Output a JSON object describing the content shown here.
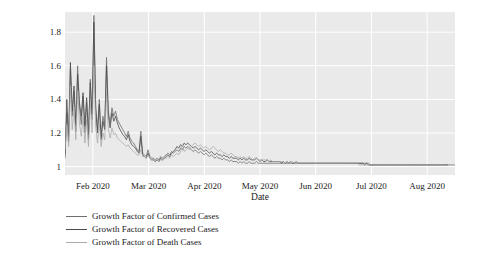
{
  "chart_data": {
    "type": "line",
    "title": "",
    "xlabel": "Date",
    "ylabel": "Growth Factor",
    "grid": true,
    "legend_position": "below-left",
    "xlim": [
      "2020-01-23",
      "2020-09-05"
    ],
    "ylim": [
      0.95,
      1.92
    ],
    "xticks": [
      "Feb 2020",
      "Mar 2020",
      "Apr 2020",
      "May 2020",
      "Jun 2020",
      "Jul 2020",
      "Aug 2020"
    ],
    "yticks": [
      "1",
      "1.2",
      "1.4",
      "1.6",
      "1.8"
    ],
    "ytick_values": [
      1,
      1.2,
      1.4,
      1.6,
      1.8
    ],
    "colors": {
      "confirmed": "#6e6e6e",
      "recovered": "#4a4a4a",
      "death": "#aaaaaa",
      "plot_background": "#eaeaea",
      "grid": "#ffffff",
      "text": "#1a1a1a"
    },
    "series": [
      {
        "name": "Growth Factor of Confirmed Cases",
        "color": "#6e6e6e",
        "values": [
          1.07,
          1.32,
          1.18,
          1.58,
          1.3,
          1.45,
          1.21,
          1.6,
          1.35,
          1.25,
          1.42,
          1.2,
          1.38,
          1.16,
          1.52,
          1.28,
          1.9,
          1.36,
          1.22,
          1.4,
          1.18,
          1.3,
          1.24,
          1.65,
          1.33,
          1.26,
          1.35,
          1.3,
          1.33,
          1.28,
          1.26,
          1.24,
          1.22,
          1.2,
          1.18,
          1.21,
          1.17,
          1.15,
          1.14,
          1.12,
          1.1,
          1.09,
          1.21,
          1.08,
          1.07,
          1.06,
          1.1,
          1.06,
          1.05,
          1.05,
          1.04,
          1.05,
          1.04,
          1.06,
          1.05,
          1.06,
          1.07,
          1.08,
          1.07,
          1.09,
          1.08,
          1.09,
          1.1,
          1.09,
          1.11,
          1.1,
          1.12,
          1.11,
          1.12,
          1.11,
          1.1,
          1.09,
          1.1,
          1.09,
          1.08,
          1.09,
          1.08,
          1.07,
          1.08,
          1.07,
          1.06,
          1.07,
          1.06,
          1.05,
          1.06,
          1.05,
          1.05,
          1.04,
          1.05,
          1.04,
          1.04,
          1.03,
          1.04,
          1.03,
          1.03,
          1.03,
          1.02,
          1.03,
          1.02,
          1.03,
          1.02,
          1.02,
          1.03,
          1.02,
          1.02,
          1.02,
          1.03,
          1.02,
          1.02,
          1.02,
          1.02,
          1.02,
          1.02,
          1.02,
          1.02,
          1.02,
          1.02,
          1.02,
          1.02,
          1.02,
          1.02,
          1.02,
          1.02,
          1.02,
          1.02,
          1.02,
          1.02,
          1.02,
          1.02,
          1.02,
          1.02,
          1.02,
          1.02,
          1.02,
          1.02,
          1.02,
          1.02,
          1.02,
          1.02,
          1.02,
          1.02,
          1.02,
          1.02,
          1.02,
          1.02,
          1.02,
          1.02,
          1.02,
          1.02,
          1.02,
          1.02,
          1.02,
          1.02,
          1.02,
          1.02,
          1.02,
          1.02,
          1.02,
          1.02,
          1.02,
          1.02,
          1.02,
          1.02,
          1.02,
          1.02,
          1.02,
          1.02,
          1.02,
          1.02,
          1.01,
          1.01,
          1.01,
          1.01,
          1.01,
          1.01,
          1.01,
          1.01,
          1.01,
          1.01,
          1.01,
          1.01,
          1.01,
          1.01,
          1.01,
          1.01,
          1.01,
          1.01,
          1.01,
          1.01,
          1.01,
          1.01,
          1.01,
          1.01,
          1.01,
          1.01,
          1.01,
          1.01,
          1.01,
          1.01,
          1.01,
          1.01,
          1.01,
          1.01,
          1.01,
          1.01,
          1.01,
          1.01,
          1.01,
          1.01,
          1.01,
          1.01,
          1.01,
          1.01,
          1.01,
          1.01,
          1.01,
          1.01
        ]
      },
      {
        "name": "Growth Factor of Recovered Cases",
        "color": "#4a4a4a",
        "values": [
          1.05,
          1.4,
          1.15,
          1.62,
          1.33,
          1.48,
          1.25,
          1.55,
          1.38,
          1.3,
          1.44,
          1.24,
          1.41,
          1.19,
          1.5,
          1.31,
          1.86,
          1.34,
          1.2,
          1.37,
          1.16,
          1.27,
          1.22,
          1.6,
          1.3,
          1.23,
          1.32,
          1.27,
          1.3,
          1.26,
          1.23,
          1.21,
          1.19,
          1.18,
          1.16,
          1.19,
          1.15,
          1.13,
          1.12,
          1.11,
          1.09,
          1.08,
          1.18,
          1.07,
          1.06,
          1.05,
          1.08,
          1.05,
          1.04,
          1.04,
          1.03,
          1.04,
          1.03,
          1.05,
          1.04,
          1.05,
          1.06,
          1.07,
          1.06,
          1.08,
          1.09,
          1.1,
          1.12,
          1.11,
          1.13,
          1.12,
          1.14,
          1.13,
          1.14,
          1.13,
          1.12,
          1.11,
          1.12,
          1.11,
          1.1,
          1.11,
          1.1,
          1.09,
          1.1,
          1.09,
          1.08,
          1.09,
          1.08,
          1.07,
          1.08,
          1.07,
          1.07,
          1.06,
          1.07,
          1.06,
          1.06,
          1.05,
          1.06,
          1.05,
          1.05,
          1.05,
          1.04,
          1.05,
          1.04,
          1.05,
          1.04,
          1.04,
          1.05,
          1.04,
          1.04,
          1.04,
          1.05,
          1.04,
          1.03,
          1.04,
          1.03,
          1.03,
          1.04,
          1.03,
          1.03,
          1.03,
          1.03,
          1.03,
          1.03,
          1.03,
          1.02,
          1.03,
          1.02,
          1.03,
          1.02,
          1.03,
          1.02,
          1.02,
          1.03,
          1.02,
          1.02,
          1.02,
          1.02,
          1.02,
          1.02,
          1.02,
          1.02,
          1.02,
          1.02,
          1.02,
          1.02,
          1.02,
          1.02,
          1.02,
          1.02,
          1.02,
          1.02,
          1.02,
          1.02,
          1.02,
          1.02,
          1.02,
          1.02,
          1.02,
          1.02,
          1.02,
          1.02,
          1.02,
          1.02,
          1.02,
          1.02,
          1.02,
          1.02,
          1.02,
          1.02,
          1.02,
          1.01,
          1.02,
          1.01,
          1.01,
          1.01,
          1.01,
          1.01,
          1.01,
          1.01,
          1.01,
          1.01,
          1.01,
          1.01,
          1.01,
          1.01,
          1.01,
          1.01,
          1.01,
          1.01,
          1.01,
          1.01,
          1.01,
          1.01,
          1.01,
          1.01,
          1.01,
          1.01,
          1.01,
          1.01,
          1.01,
          1.01,
          1.01,
          1.01,
          1.01,
          1.01,
          1.01,
          1.01,
          1.01,
          1.01,
          1.01,
          1.01,
          1.01,
          1.01,
          1.01,
          1.01,
          1.01,
          1.01
        ]
      },
      {
        "name": "Growth Factor of Death Cases",
        "color": "#aaaaaa",
        "values": [
          1.1,
          1.25,
          1.12,
          1.48,
          1.22,
          1.35,
          1.16,
          1.45,
          1.26,
          1.18,
          1.3,
          1.14,
          1.28,
          1.12,
          1.38,
          1.2,
          1.6,
          1.24,
          1.14,
          1.26,
          1.12,
          1.2,
          1.16,
          1.44,
          1.22,
          1.17,
          1.23,
          1.19,
          1.2,
          1.17,
          1.16,
          1.15,
          1.14,
          1.13,
          1.12,
          1.13,
          1.11,
          1.1,
          1.09,
          1.08,
          1.07,
          1.07,
          1.1,
          1.06,
          1.06,
          1.05,
          1.07,
          1.05,
          1.04,
          1.04,
          1.04,
          1.04,
          1.03,
          1.04,
          1.04,
          1.05,
          1.05,
          1.06,
          1.05,
          1.07,
          1.06,
          1.07,
          1.08,
          1.07,
          1.09,
          1.13,
          1.09,
          1.1,
          1.11,
          1.1,
          1.12,
          1.13,
          1.14,
          1.13,
          1.12,
          1.13,
          1.12,
          1.11,
          1.12,
          1.11,
          1.1,
          1.11,
          1.12,
          1.11,
          1.1,
          1.09,
          1.1,
          1.09,
          1.08,
          1.08,
          1.07,
          1.07,
          1.08,
          1.07,
          1.06,
          1.06,
          1.05,
          1.06,
          1.05,
          1.06,
          1.05,
          1.05,
          1.06,
          1.05,
          1.04,
          1.05,
          1.05,
          1.04,
          1.04,
          1.04,
          1.04,
          1.04,
          1.04,
          1.03,
          1.04,
          1.03,
          1.03,
          1.03,
          1.03,
          1.03,
          1.03,
          1.03,
          1.02,
          1.03,
          1.02,
          1.02,
          1.03,
          1.02,
          1.02,
          1.02,
          1.02,
          1.02,
          1.02,
          1.02,
          1.02,
          1.02,
          1.02,
          1.02,
          1.02,
          1.02,
          1.02,
          1.02,
          1.02,
          1.02,
          1.02,
          1.02,
          1.02,
          1.02,
          1.02,
          1.02,
          1.02,
          1.02,
          1.02,
          1.02,
          1.02,
          1.02,
          1.02,
          1.02,
          1.02,
          1.02,
          1.02,
          1.02,
          1.02,
          1.01,
          1.01,
          1.01,
          1.01,
          1.01,
          1.01,
          1.01,
          1.01,
          1.01,
          1.01,
          1.01,
          1.01,
          1.01,
          1.01,
          1.01,
          1.01,
          1.01,
          1.01,
          1.01,
          1.01,
          1.01,
          1.01,
          1.01,
          1.01,
          1.01,
          1.01,
          1.01,
          1.01,
          1.01,
          1.01,
          1.01,
          1.01,
          1.01,
          1.01,
          1.01,
          1.01,
          1.01,
          1.01,
          1.01,
          1.01,
          1.01,
          1.01,
          1.01,
          1.01,
          1.01,
          1.01,
          1.01,
          1.01,
          1.01
        ]
      }
    ]
  },
  "legend": {
    "items": [
      {
        "label": "Growth Factor of Confirmed Cases",
        "color": "#6e6e6e"
      },
      {
        "label": "Growth Factor of Recovered Cases",
        "color": "#4a4a4a"
      },
      {
        "label": "Growth Factor of Death Cases",
        "color": "#aaaaaa"
      }
    ]
  }
}
